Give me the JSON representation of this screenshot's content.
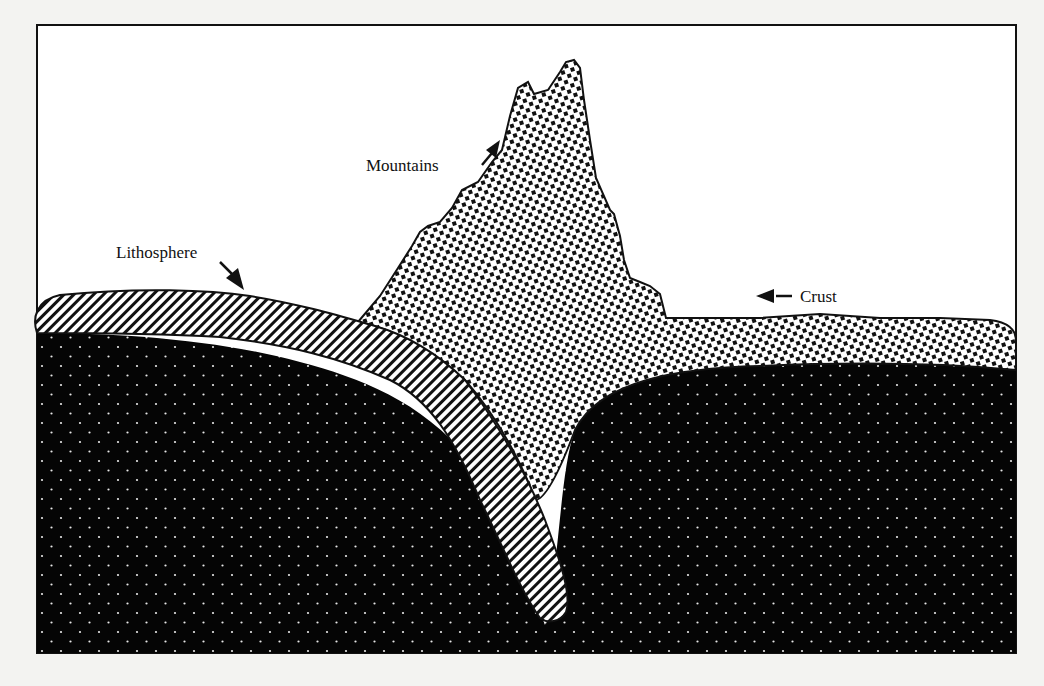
{
  "figure": {
    "type": "cross-section",
    "colors": {
      "background": "#f3f3f1",
      "frame": "#111111",
      "mantle_fill": "#050505",
      "mantle_dot": "#e8e8e8",
      "ink": "#111111",
      "paper": "#ffffff"
    }
  },
  "labels": {
    "mountains": "Mountains",
    "lithosphere": "Lithosphere",
    "crust": "Crust"
  },
  "legend_patterns": {
    "lithosphere": "diagonal-hatch",
    "crust_and_mountains": "checker-dots",
    "mantle": "black-with-white-dots"
  }
}
